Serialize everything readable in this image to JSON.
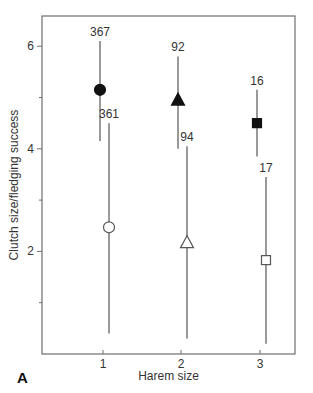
{
  "chart_data": {
    "type": "scatter",
    "panel_label": "A",
    "title": "",
    "xlabel": "Harem size",
    "ylabel": "Clutch size/fledging success",
    "x_ticks": [
      1,
      2,
      3
    ],
    "y_ticks": [
      2,
      4,
      6
    ],
    "y_minor_ticks": [
      1,
      3,
      5
    ],
    "xlim": [
      0.2,
      3.4
    ],
    "ylim": [
      0,
      6.6
    ],
    "grid": false,
    "legend": null,
    "series": [
      {
        "name": "Clutch size",
        "fill": "filled",
        "points": [
          {
            "x": 1,
            "marker": "circle",
            "y": 5.15,
            "err_low": 4.15,
            "err_high": 6.1,
            "n": 367
          },
          {
            "x": 2,
            "marker": "triangle",
            "y": 4.95,
            "err_low": 4.0,
            "err_high": 5.8,
            "n": 92
          },
          {
            "x": 3,
            "marker": "square",
            "y": 4.5,
            "err_low": 3.85,
            "err_high": 5.15,
            "n": 16
          }
        ]
      },
      {
        "name": "Fledging success",
        "fill": "open",
        "points": [
          {
            "x": 1,
            "marker": "circle",
            "y": 2.47,
            "err_low": 0.4,
            "err_high": 4.5,
            "n": 361
          },
          {
            "x": 2,
            "marker": "triangle",
            "y": 2.17,
            "err_low": 0.3,
            "err_high": 4.05,
            "n": 94
          },
          {
            "x": 3,
            "marker": "square",
            "y": 1.83,
            "err_low": 0.2,
            "err_high": 3.45,
            "n": 17
          }
        ]
      }
    ]
  },
  "colors": {
    "axis": "#6e6e6e",
    "errorbar": "#555555",
    "marker_filled": "#111111",
    "marker_open_fill": "#ffffff",
    "marker_open_stroke": "#555555",
    "text": "#333333"
  }
}
